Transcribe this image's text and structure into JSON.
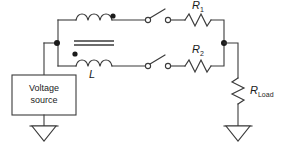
{
  "diagram": {
    "canvas": {
      "width": 282,
      "height": 145,
      "background": "#ffffff"
    },
    "stroke_color": "#3b3b3b",
    "text_color": "#1b1b1b"
  },
  "components": {
    "voltage_source": {
      "label_line1": "Voltage",
      "label_line2": "source",
      "shape": "rectangle"
    },
    "inductor": {
      "label": "L",
      "label_sub": "",
      "type": "coupled-inductor",
      "windings": 2,
      "core": "two-parallel-lines",
      "dot_top": "right",
      "dot_bottom": "left"
    },
    "switch_top": {
      "name": "switch-1",
      "state": "open"
    },
    "switch_bottom": {
      "name": "switch-2",
      "state": "open"
    },
    "resistor_1": {
      "label": "R",
      "label_sub": "1"
    },
    "resistor_2": {
      "label": "R",
      "label_sub": "2"
    },
    "resistor_load": {
      "label": "R",
      "label_sub": "Load"
    },
    "ground_left": {
      "symbol": "triangle-ground"
    },
    "ground_right": {
      "symbol": "triangle-ground"
    }
  },
  "nodes": {
    "left_junction": "node-left",
    "right_junction": "node-right"
  }
}
